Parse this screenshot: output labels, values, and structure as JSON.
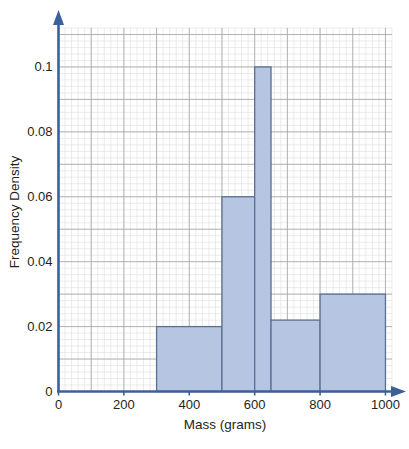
{
  "chart_data": {
    "type": "bar",
    "title": "",
    "subtitle": "",
    "xlabel": "Mass (grams)",
    "ylabel": "Frequency Density",
    "xlim": [
      0,
      1020
    ],
    "ylim": [
      0,
      0.112
    ],
    "grid": true,
    "legend": "none",
    "x_ticks": [
      "0",
      "200",
      "400",
      "600",
      "800",
      "1000"
    ],
    "x_tick_values": [
      0,
      200,
      400,
      600,
      800,
      1000
    ],
    "y_ticks": [
      "0",
      "0.02",
      "0.04",
      "0.06",
      "0.08",
      "0.1"
    ],
    "y_tick_values": [
      0,
      0.02,
      0.04,
      0.06,
      0.08,
      0.1
    ],
    "x_major_step": 100,
    "x_minor_step": 20,
    "y_major_step": 0.01,
    "y_minor_step": 0.002,
    "bar_fill": "#b6c6e2",
    "bar_stroke": "#5a6f93",
    "axis_color": "#3c6099",
    "grid_major_color": "#a9a9a9",
    "grid_minor_color": "#dedede",
    "categories": [
      "300-500",
      "500-600",
      "600-650",
      "650-800",
      "800-1000"
    ],
    "bins": [
      {
        "label": "300-500",
        "start": 300,
        "end": 500,
        "value": 0.02
      },
      {
        "label": "500-600",
        "start": 500,
        "end": 600,
        "value": 0.06
      },
      {
        "label": "600-650",
        "start": 600,
        "end": 650,
        "value": 0.1
      },
      {
        "label": "650-800",
        "start": 650,
        "end": 800,
        "value": 0.022
      },
      {
        "label": "800-1000",
        "start": 800,
        "end": 1000,
        "value": 0.03
      }
    ],
    "values": [
      0.02,
      0.06,
      0.1,
      0.022,
      0.03
    ]
  }
}
